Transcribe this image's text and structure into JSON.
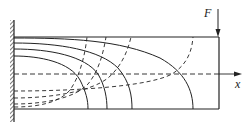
{
  "diagram": {
    "labels": {
      "force": "F",
      "axis": "x"
    },
    "colors": {
      "stroke": "#222222",
      "background": "#ffffff"
    },
    "beam": {
      "left": 14,
      "right": 219,
      "top": 37,
      "bottom": 109,
      "neutral_axis_y": 74
    },
    "solid_curves": [
      {
        "start_y": 43,
        "end_x": 193
      },
      {
        "start_y": 49,
        "end_x": 132
      },
      {
        "start_y": 56,
        "end_x": 107
      },
      {
        "start_y": 57,
        "end_x": 88
      }
    ],
    "dashed_curves": [
      {
        "start_y": 91,
        "end_x": 193
      },
      {
        "start_y": 98,
        "end_x": 131
      },
      {
        "start_y": 104,
        "end_x": 106
      },
      {
        "start_y": 107,
        "end_x": 87
      }
    ],
    "legend": {
      "solid": "tension trajectories",
      "dashed": "compression trajectories"
    }
  }
}
